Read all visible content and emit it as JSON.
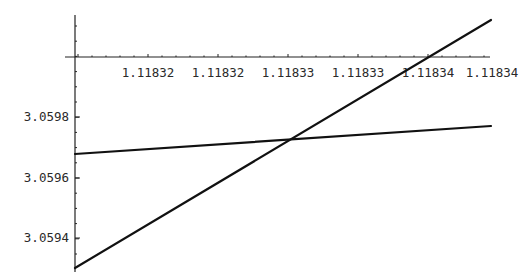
{
  "chart_data": {
    "type": "line",
    "title": "",
    "xlabel": "",
    "ylabel": "",
    "x_tick_labels": [
      "1.11832",
      "1.11832",
      "1.11833",
      "1.11833",
      "1.11834",
      "1.11834"
    ],
    "y_tick_labels": [
      "3.0598",
      "3.0596",
      "3.0594"
    ],
    "xlim": [
      1.118315,
      1.118345
    ],
    "ylim": [
      3.05929,
      3.06009
    ],
    "grid": false,
    "legend": null,
    "series": [
      {
        "name": "steep line",
        "x": [
          1.118315,
          1.118345
        ],
        "y": [
          3.0593,
          3.06005
        ]
      },
      {
        "name": "shallow line",
        "x": [
          1.118315,
          1.118345
        ],
        "y": [
          3.05967,
          3.05977
        ]
      }
    ],
    "annotations": [
      "Two straight lines intersecting near x≈1.11833, y≈3.05973"
    ]
  },
  "colors": {
    "line": "#111111",
    "axis": "#222222",
    "background": "#ffffff"
  }
}
